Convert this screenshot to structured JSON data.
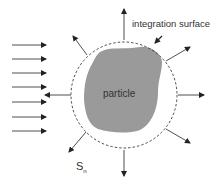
{
  "labels": {
    "integration_surface": "integration surface",
    "particle": "particle",
    "surface_symbol": "S",
    "surface_subscript": "n"
  },
  "colors": {
    "particle_fill": "#9a9a9a",
    "lines": "#222222",
    "background": "#ffffff"
  }
}
